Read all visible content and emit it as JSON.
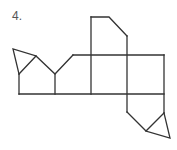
{
  "problem": {
    "number_label": "4."
  },
  "diagram": {
    "stroke_color": "#333333",
    "background_color": "#ffffff"
  }
}
